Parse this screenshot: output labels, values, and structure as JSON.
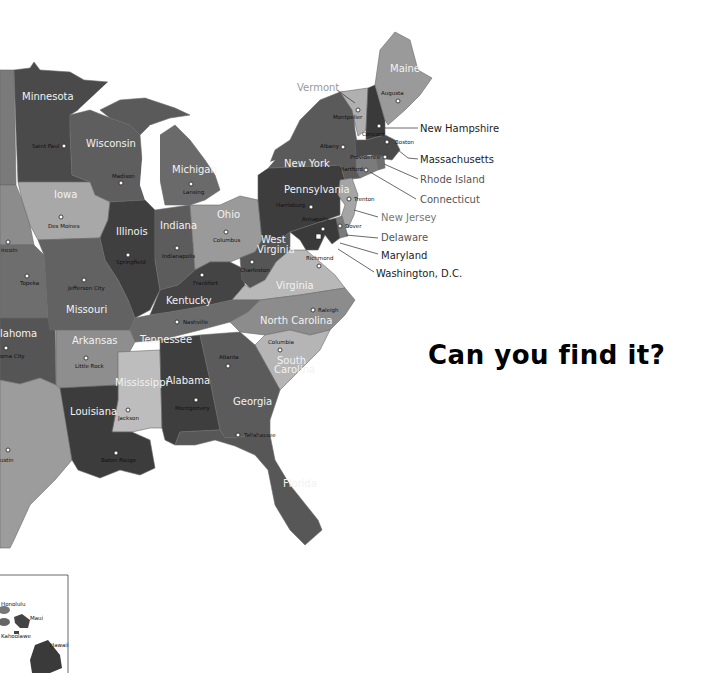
{
  "headline": "Can you find it?",
  "colors": {
    "background": "#ffffff",
    "darkest": "#3c3c3c",
    "dark": "#4f4f4f",
    "mid": "#6b6b6b",
    "light": "#9a9a9a",
    "lighter": "#b9b9b9",
    "water": "#ffffff"
  },
  "states": {
    "minnesota": {
      "name": "Minnesota",
      "capital": "Saint Paul"
    },
    "wisconsin": {
      "name": "Wisconsin",
      "capital": "Madison"
    },
    "michigan": {
      "name": "Michigan",
      "capital": "Lansing"
    },
    "iowa": {
      "name": "Iowa",
      "capital": "Des Moines"
    },
    "illinois": {
      "name": "Illinois",
      "capital": "Springfield"
    },
    "indiana": {
      "name": "Indiana",
      "capital": "Indianapolis"
    },
    "ohio": {
      "name": "Ohio",
      "capital": "Columbus"
    },
    "nebraska": {
      "name": "",
      "capital": "Lincoln (partial)"
    },
    "kansas": {
      "name": "",
      "capital": "Topeka"
    },
    "missouri": {
      "name": "Missouri",
      "capital": "Jefferson City"
    },
    "kentucky": {
      "name": "Kentucky",
      "capital": "Frankfort"
    },
    "west_virginia": {
      "name": "West Virginia",
      "capital": "Charleston"
    },
    "virginia": {
      "name": "Virginia",
      "capital": "Richmond"
    },
    "oklahoma": {
      "name": "Oklahoma (partial)",
      "capital": "Oklahoma City (partial)"
    },
    "arkansas": {
      "name": "Arkansas",
      "capital": "Little Rock"
    },
    "tennessee": {
      "name": "Tennessee",
      "capital": "Nashville"
    },
    "north_carolina": {
      "name": "North Carolina",
      "capital": "Raleigh"
    },
    "south_carolina": {
      "name": "South Carolina",
      "capital": "Columbia"
    },
    "mississippi": {
      "name": "Mississippi",
      "capital": "Jackson"
    },
    "alabama": {
      "name": "Alabama",
      "capital": "Montgomery"
    },
    "georgia": {
      "name": "Georgia",
      "capital": "Atlanta"
    },
    "louisiana": {
      "name": "Louisiana",
      "capital": "Baton Rouge"
    },
    "texas": {
      "name": "",
      "capital": "Austin (partial)"
    },
    "florida": {
      "name": "Florida",
      "capital": "Tallahassee"
    },
    "pennsylvania": {
      "name": "Pennsylvania",
      "capital": "Harrisburg"
    },
    "new_york": {
      "name": "New York",
      "capital": "Albany"
    },
    "vermont": {
      "name": "Vermont",
      "capital": "Montpelier"
    },
    "new_hampshire": {
      "name": "New Hampshire",
      "capital": "Concord"
    },
    "maine": {
      "name": "Maine",
      "capital": "Augusta"
    },
    "massachusetts": {
      "name": "Massachusetts",
      "capital": "Boston"
    },
    "rhode_island": {
      "name": "Rhode Island",
      "capital": "Providence"
    },
    "connecticut": {
      "name": "Connecticut",
      "capital": "Hartford"
    },
    "new_jersey": {
      "name": "New Jersey",
      "capital": "Trenton"
    },
    "delaware": {
      "name": "Delaware",
      "capital": "Dover"
    },
    "maryland": {
      "name": "Maryland",
      "capital": "Annapolis"
    },
    "dc": {
      "name": "Washington, D.C."
    }
  },
  "labels": {
    "minnesota": "Minnesota",
    "saint_paul": "Saint Paul",
    "wisconsin": "Wisconsin",
    "madison": "Madison",
    "michigan": "Michigan",
    "lansing": "Lansing",
    "iowa": "Iowa",
    "des_moines": "Des Moines",
    "illinois": "Illinois",
    "springfield": "Springfield",
    "indiana": "Indiana",
    "indianapolis": "Indianapolis",
    "ohio": "Ohio",
    "columbus": "Columbus",
    "lincoln": "incoln",
    "topeka": "Topeka",
    "jefferson_city": "Jefferson City",
    "missouri": "Missouri",
    "kentucky": "Kentucky",
    "frankfort": "Frankfort",
    "west": "West",
    "virginia_w": "Virginia",
    "charleston": "Charleston",
    "richmond": "Richmond",
    "virginia": "Virginia",
    "oklahoma": "lahoma",
    "okc": "oma City",
    "arkansas": "Arkansas",
    "little_rock": "Little Rock",
    "tennessee": "Tennessee",
    "nashville": "Nashville",
    "north_carolina": "North Carolina",
    "raleigh": "Raleigh",
    "columbia": "Columbia",
    "south": "South",
    "carolina": "Carolina",
    "mississippi": "Mississippi",
    "jackson": "Jackson",
    "alabama": "Alabama",
    "montgomery": "Montgomery",
    "atlanta": "Atlanta",
    "georgia": "Georgia",
    "louisiana": "Louisiana",
    "baton_rouge": "Baton Rouge",
    "austin": "ustin",
    "tallahassee": "Tallahassee",
    "florida": "Florida",
    "pennsylvania": "Pennsylvania",
    "harrisburg": "Harrisburg",
    "new_york": "New York",
    "albany": "Albany",
    "montpelier": "Montpelier",
    "maine": "Maine",
    "augusta": "Augusta",
    "concord": "Concord",
    "boston": "Boston",
    "providence": "Providence",
    "hartford": "Hartford",
    "trenton": "Trenton",
    "annapolis": "Annapolis",
    "dover": "Dover"
  },
  "callouts": {
    "vermont": "Vermont",
    "new_hampshire": "New Hampshire",
    "massachusetts": "Massachusetts",
    "rhode_island": "Rhode Island",
    "connecticut": "Connecticut",
    "new_jersey": "New Jersey",
    "delaware": "Delaware",
    "maryland": "Maryland",
    "dc": "Washington, D.C."
  },
  "hawaii_inset": {
    "labels": {
      "honolulu": "Honolulu",
      "maui": "Maui",
      "kahoolawe": "Kahoolawe",
      "hawaii": "Hawaii"
    }
  }
}
